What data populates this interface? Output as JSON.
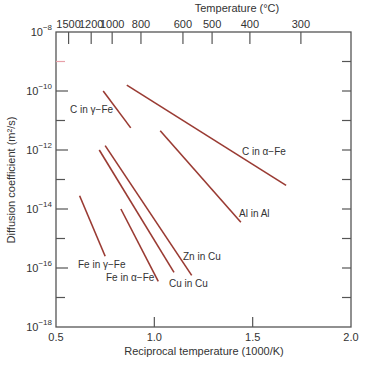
{
  "chart_data": {
    "type": "line",
    "title": "",
    "xlabel": "Reciprocal temperature (1000/K)",
    "ylabel": "Diffusion coefficient (m²/s)",
    "top_xlabel": "Temperature (°C)",
    "xlim": [
      0.5,
      2.0
    ],
    "ylim_log10": [
      -18,
      -8
    ],
    "y_scale": "log",
    "grid": false,
    "legend": "inline labels",
    "x_ticks": [
      {
        "value": 0.5,
        "label": "0.5"
      },
      {
        "value": 1.0,
        "label": "1.0"
      },
      {
        "value": 1.5,
        "label": "1.5"
      },
      {
        "value": 2.0,
        "label": "2.0"
      }
    ],
    "y_ticks": [
      {
        "exp": -8,
        "base": "10",
        "sup": "−8"
      },
      {
        "exp": -10,
        "base": "10",
        "sup": "−10"
      },
      {
        "exp": -12,
        "base": "10",
        "sup": "−12"
      },
      {
        "exp": -14,
        "base": "10",
        "sup": "−14"
      },
      {
        "exp": -16,
        "base": "10",
        "sup": "−16"
      },
      {
        "exp": -18,
        "base": "10",
        "sup": "−18"
      }
    ],
    "top_ticks": [
      {
        "celsius": 1500,
        "label": "1500"
      },
      {
        "celsius": 1200,
        "label": "1200"
      },
      {
        "celsius": 1000,
        "label": "1000"
      },
      {
        "celsius": 800,
        "label": "800"
      },
      {
        "celsius": 600,
        "label": "600"
      },
      {
        "celsius": 500,
        "label": "500"
      },
      {
        "celsius": 400,
        "label": "400"
      },
      {
        "celsius": 300,
        "label": "300"
      }
    ],
    "line_color": "#9a3b33",
    "series": [
      {
        "name": "C in γ−Fe",
        "x": [
          0.74,
          0.88
        ],
        "log10_D": [
          -10.0,
          -11.25
        ],
        "label_pos": [
          70,
          113
        ]
      },
      {
        "name": "C in α−Fe",
        "x": [
          0.86,
          1.67
        ],
        "log10_D": [
          -9.8,
          -13.2
        ],
        "label_pos": [
          242,
          155
        ]
      },
      {
        "name": "Al in Al",
        "x": [
          1.03,
          1.44
        ],
        "log10_D": [
          -11.35,
          -14.45
        ],
        "label_pos": [
          239,
          217
        ]
      },
      {
        "name": "Zn in Cu",
        "x": [
          0.75,
          1.19
        ],
        "log10_D": [
          -11.85,
          -16.25
        ],
        "label_pos": [
          183,
          260
        ]
      },
      {
        "name": "Cu in Cu",
        "x": [
          0.72,
          1.1
        ],
        "log10_D": [
          -12.0,
          -16.15
        ],
        "label_pos": [
          169,
          287
        ]
      },
      {
        "name": "Fe in α−Fe",
        "x": [
          0.83,
          1.02
        ],
        "log10_D": [
          -14.0,
          -16.45
        ],
        "label_pos": [
          106,
          281
        ]
      },
      {
        "name": "Fe in γ−Fe",
        "x": [
          0.62,
          0.75
        ],
        "log10_D": [
          -13.55,
          -15.6
        ],
        "label_pos": [
          78,
          268
        ]
      }
    ]
  }
}
